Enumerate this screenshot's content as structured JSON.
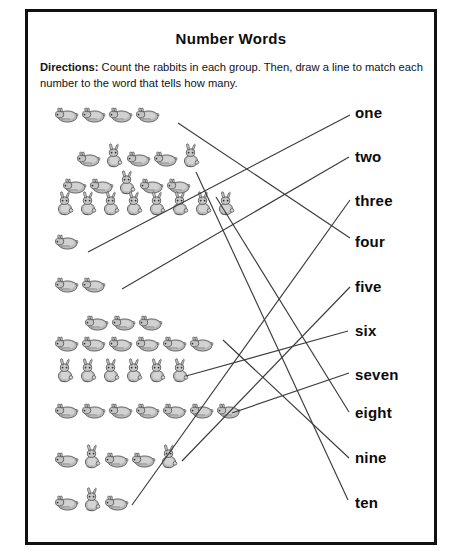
{
  "worksheet": {
    "title": "Number Words",
    "directions_label": "Directions:",
    "directions_text": " Count the rabbits in each group. Then, draw a line to match each number to the word that tells how many.",
    "border_color": "#111111",
    "text_color": "#0d0d0d",
    "line_color": "#3c3c3c",
    "page_background": "#ffffff"
  },
  "rabbit_groups": [
    {
      "id": "group-1",
      "count": 4,
      "rows": [
        4
      ],
      "pose": "lying",
      "top": 0,
      "left": 18
    },
    {
      "id": "group-2",
      "count": 10,
      "rows": [
        5,
        5
      ],
      "pose": "mixed",
      "top": 38,
      "left": 26
    },
    {
      "id": "group-3",
      "count": 8,
      "rows": [
        8
      ],
      "pose": "standing",
      "top": 86,
      "left": 18
    },
    {
      "id": "group-4",
      "count": 1,
      "rows": [
        1
      ],
      "pose": "lying",
      "top": 127,
      "left": 18
    },
    {
      "id": "group-5",
      "count": 2,
      "rows": [
        2
      ],
      "pose": "lying",
      "top": 170,
      "left": 18
    },
    {
      "id": "group-6",
      "count": 9,
      "rows": [
        3,
        6
      ],
      "pose": "lying",
      "top": 208,
      "left": 18
    },
    {
      "id": "group-7",
      "count": 6,
      "rows": [
        6
      ],
      "pose": "standing",
      "top": 253,
      "left": 18
    },
    {
      "id": "group-8",
      "count": 7,
      "rows": [
        7
      ],
      "pose": "lying",
      "top": 296,
      "left": 18
    },
    {
      "id": "group-9",
      "count": 5,
      "rows": [
        5
      ],
      "pose": "mixed",
      "top": 339,
      "left": 18
    },
    {
      "id": "group-10",
      "count": 3,
      "rows": [
        3
      ],
      "pose": "mixed",
      "top": 382,
      "left": 18
    }
  ],
  "number_words": [
    {
      "id": "word-one",
      "label": "one",
      "value": 1,
      "top": 0
    },
    {
      "id": "word-two",
      "label": "two",
      "value": 2,
      "top": 44
    },
    {
      "id": "word-three",
      "label": "three",
      "value": 3,
      "top": 88
    },
    {
      "id": "word-four",
      "label": "four",
      "value": 4,
      "top": 129
    },
    {
      "id": "word-five",
      "label": "five",
      "value": 5,
      "top": 174
    },
    {
      "id": "word-six",
      "label": "six",
      "value": 6,
      "top": 218
    },
    {
      "id": "word-seven",
      "label": "seven",
      "value": 7,
      "top": 262
    },
    {
      "id": "word-eight",
      "label": "eight",
      "value": 8,
      "top": 300
    },
    {
      "id": "word-nine",
      "label": "nine",
      "value": 9,
      "top": 345
    },
    {
      "id": "word-ten",
      "label": "ten",
      "value": 10,
      "top": 390
    }
  ],
  "match_lines": [
    {
      "id": "line-group1-to-four",
      "from_group": "group-1",
      "to_word": "word-four",
      "x1": 178,
      "y1": 123,
      "x2": 350,
      "y2": 238
    },
    {
      "id": "line-group2-to-ten",
      "from_group": "group-2",
      "to_word": "word-ten",
      "x1": 196,
      "y1": 172,
      "x2": 348,
      "y2": 500
    },
    {
      "id": "line-group3-to-eight",
      "from_group": "group-3",
      "to_word": "word-eight",
      "x1": 216,
      "y1": 197,
      "x2": 349,
      "y2": 412
    },
    {
      "id": "line-group4-to-one",
      "from_group": "group-4",
      "to_word": "word-one",
      "x1": 88,
      "y1": 252,
      "x2": 350,
      "y2": 115
    },
    {
      "id": "line-group5-to-two",
      "from_group": "group-5",
      "to_word": "word-two",
      "x1": 122,
      "y1": 289,
      "x2": 349,
      "y2": 157
    },
    {
      "id": "line-group6-to-nine",
      "from_group": "group-6",
      "to_word": "word-nine",
      "x1": 223,
      "y1": 340,
      "x2": 349,
      "y2": 458
    },
    {
      "id": "line-group7-to-six",
      "from_group": "group-7",
      "to_word": "word-six",
      "x1": 186,
      "y1": 376,
      "x2": 348,
      "y2": 331
    },
    {
      "id": "line-group8-to-seven",
      "from_group": "group-8",
      "to_word": "word-seven",
      "x1": 232,
      "y1": 413,
      "x2": 349,
      "y2": 373
    },
    {
      "id": "line-group9-to-five",
      "from_group": "group-9",
      "to_word": "word-five",
      "x1": 182,
      "y1": 461,
      "x2": 350,
      "y2": 287
    },
    {
      "id": "line-group10-to-three",
      "from_group": "group-10",
      "to_word": "word-three",
      "x1": 132,
      "y1": 505,
      "x2": 350,
      "y2": 200
    }
  ]
}
